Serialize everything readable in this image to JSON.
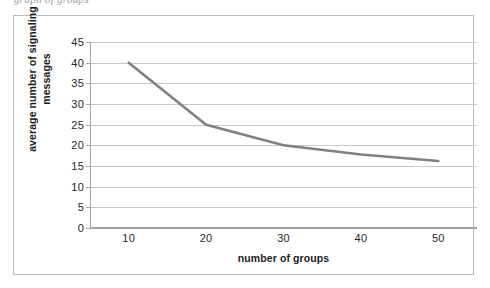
{
  "clipped_caption": "graph of groups",
  "colors": {
    "series_line": "#808080",
    "gridline": "#c8c8c8",
    "axis_line": "#a0a0a0",
    "frame_border": "#b9b9b9",
    "text": "#262626",
    "background": "#ffffff"
  },
  "chart_data": {
    "type": "line",
    "title": "",
    "subtitle": "",
    "xlabel": "number of groups",
    "ylabel": "average number of signaling messages",
    "x": [
      10,
      20,
      30,
      40,
      50
    ],
    "xtick_labels": [
      "10",
      "20",
      "30",
      "40",
      "50"
    ],
    "ytick_labels": [
      "0",
      "5",
      "10",
      "15",
      "20",
      "25",
      "30",
      "35",
      "40",
      "45"
    ],
    "ytick_values": [
      0,
      5,
      10,
      15,
      20,
      25,
      30,
      35,
      40,
      45
    ],
    "xlim": [
      5,
      55
    ],
    "ylim": [
      0,
      45
    ],
    "grid": "horizontal",
    "legend": "none",
    "markers": false,
    "series": [
      {
        "name": "average number of signaling messages",
        "values": [
          40.0,
          25.0,
          20.0,
          17.8,
          16.2
        ],
        "color": "#808080"
      }
    ]
  }
}
